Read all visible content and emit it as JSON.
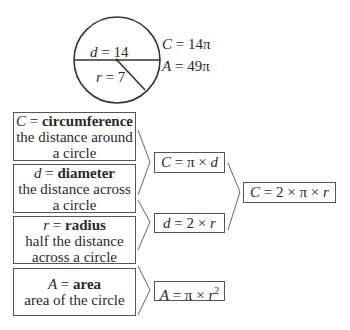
{
  "circle": {
    "diameter_label": {
      "var": "d",
      "eq": " = 14"
    },
    "radius_label": {
      "var": "r",
      "eq": " = 7"
    },
    "circumference_label": {
      "var": "C",
      "eq": " = 14π"
    },
    "area_label": {
      "var": "A",
      "eq": " = 49π"
    }
  },
  "definitions": [
    {
      "var": "C",
      "eq": " = ",
      "term": "circumference",
      "line1": "the distance around",
      "line2": "a circle"
    },
    {
      "var": "d",
      "eq": " = ",
      "term": "diameter",
      "line1": "the distance across",
      "line2": "a circle"
    },
    {
      "var": "r",
      "eq": " = ",
      "term": "radius",
      "line1": "half the distance",
      "line2": "across a circle"
    },
    {
      "var": "A",
      "eq": " = ",
      "term": "area",
      "line1": "area of the circle",
      "line2": ""
    }
  ],
  "formulas": {
    "circumference_d": {
      "var": "C",
      "rest": " = π × ",
      "var2": "d"
    },
    "diameter_r": {
      "var": "d",
      "rest": " = 2 × ",
      "var2": "r"
    },
    "area": {
      "var": "A",
      "rest": " = π × ",
      "var2": "r",
      "sup": "2"
    },
    "circumference_r": {
      "var": "C",
      "rest": " = 2 × π × ",
      "var2": "r"
    }
  }
}
